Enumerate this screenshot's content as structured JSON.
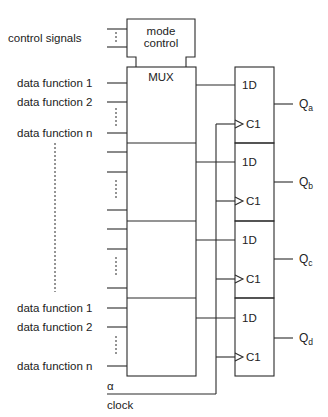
{
  "diagram": {
    "control": {
      "signals_label": "control signals",
      "block_line1": "mode",
      "block_line2": "control"
    },
    "mux": {
      "label": "MUX"
    },
    "inputs_top": [
      "data function 1",
      "data function 2",
      "data function n"
    ],
    "inputs_bottom": [
      "data function 1",
      "data function 2",
      "data function n"
    ],
    "flipflops": [
      {
        "d": "1D",
        "c": "C1",
        "q": "Q",
        "sub": "a"
      },
      {
        "d": "1D",
        "c": "C1",
        "q": "Q",
        "sub": "b"
      },
      {
        "d": "1D",
        "c": "C1",
        "q": "Q",
        "sub": "c"
      },
      {
        "d": "1D",
        "c": "C1",
        "q": "Q",
        "sub": "d"
      }
    ],
    "signals": {
      "alpha": "α",
      "clock": "clock"
    },
    "colors": {
      "line": "#2a2a2a",
      "text": "#222222",
      "background": "#ffffff"
    }
  }
}
